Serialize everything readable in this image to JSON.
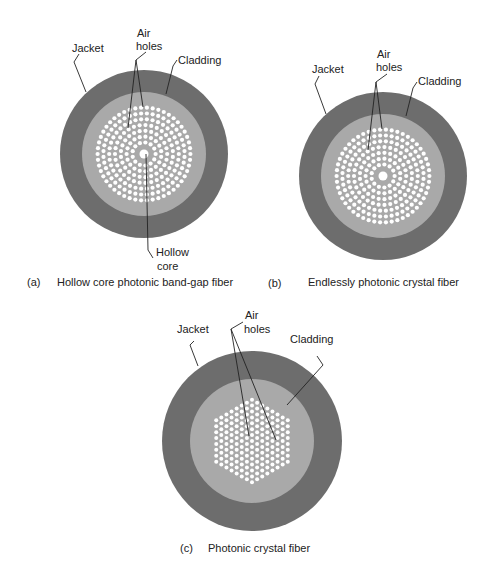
{
  "colors": {
    "jacket": "#6d6d6d",
    "cladding": "#a9a9a9",
    "hole": "#ffffff",
    "line": "#222222",
    "text": "#222222"
  },
  "fibers": [
    {
      "id": "a",
      "caption_letter": "(a)",
      "caption_text": "Hollow core photonic band-gap fiber",
      "pattern": "concentric",
      "center": [
        144,
        154
      ],
      "jacket_radius": 84,
      "cladding_radius": 62,
      "hole_region_radius": 47,
      "hole_radius": 2.1,
      "ring_pitch": 5.8,
      "core_hole_radius": 4.5,
      "labels": {
        "jacket": "Jacket",
        "air_line1": "Air",
        "air_line2": "holes",
        "cladding": "Cladding",
        "core_line1": "Hollow",
        "core_line2": "core"
      }
    },
    {
      "id": "b",
      "caption_letter": "(b)",
      "caption_text": "Endlessly photonic crystal fiber",
      "pattern": "concentric",
      "center": [
        383,
        176
      ],
      "jacket_radius": 84,
      "cladding_radius": 62,
      "hole_region_radius": 47,
      "hole_radius": 2.1,
      "ring_pitch": 5.8,
      "core_hole_radius": 4.5,
      "labels": {
        "jacket": "Jacket",
        "air_line1": "Air",
        "air_line2": "holes",
        "cladding": "Cladding"
      }
    },
    {
      "id": "c",
      "caption_letter": "(c)",
      "caption_text": "Photonic crystal fiber",
      "pattern": "hexagonal",
      "center": [
        252,
        441
      ],
      "jacket_radius": 90,
      "cladding_radius": 62,
      "hex_rings": 7,
      "hole_radius": 2.0,
      "pitch": 5.9,
      "labels": {
        "jacket": "Jacket",
        "air_line1": "Air",
        "air_line2": "holes",
        "cladding": "Cladding"
      }
    }
  ]
}
